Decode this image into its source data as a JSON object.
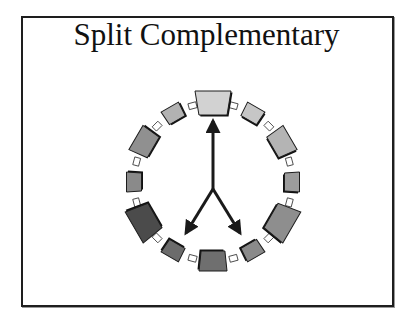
{
  "slide": {
    "title": "Split Complementary"
  },
  "diagram": {
    "type": "color-wheel",
    "scheme": "split-complementary",
    "center": [
      213,
      182
    ],
    "radius": 79,
    "segments": [
      {
        "angle": 0,
        "size": "large",
        "fill": "#d2d2d2",
        "emphasized": true
      },
      {
        "angle": 30,
        "size": "small",
        "fill": "#c6c6c6",
        "emphasized": false
      },
      {
        "angle": 60,
        "size": "medium",
        "fill": "#b4b4b4",
        "emphasized": false
      },
      {
        "angle": 90,
        "size": "small",
        "fill": "#9c9c9c",
        "emphasized": false
      },
      {
        "angle": 120,
        "size": "large",
        "fill": "#8e8e8e",
        "emphasized": true
      },
      {
        "angle": 150,
        "size": "small",
        "fill": "#8a8a8a",
        "emphasized": false
      },
      {
        "angle": 180,
        "size": "medium",
        "fill": "#6f6f6f",
        "emphasized": false
      },
      {
        "angle": 210,
        "size": "small",
        "fill": "#6c6c6c",
        "emphasized": false
      },
      {
        "angle": 240,
        "size": "large",
        "fill": "#4b4b4b",
        "emphasized": true
      },
      {
        "angle": 270,
        "size": "small",
        "fill": "#8a8a8a",
        "emphasized": false
      },
      {
        "angle": 300,
        "size": "medium",
        "fill": "#909090",
        "emphasized": false
      },
      {
        "angle": 330,
        "size": "small",
        "fill": "#b2b2b2",
        "emphasized": false
      }
    ],
    "arrows": {
      "origin": [
        213,
        189
      ],
      "targets": [
        [
          213,
          121
        ],
        [
          186,
          233
        ],
        [
          240,
          233
        ]
      ],
      "color": "#1a1a1a"
    }
  }
}
